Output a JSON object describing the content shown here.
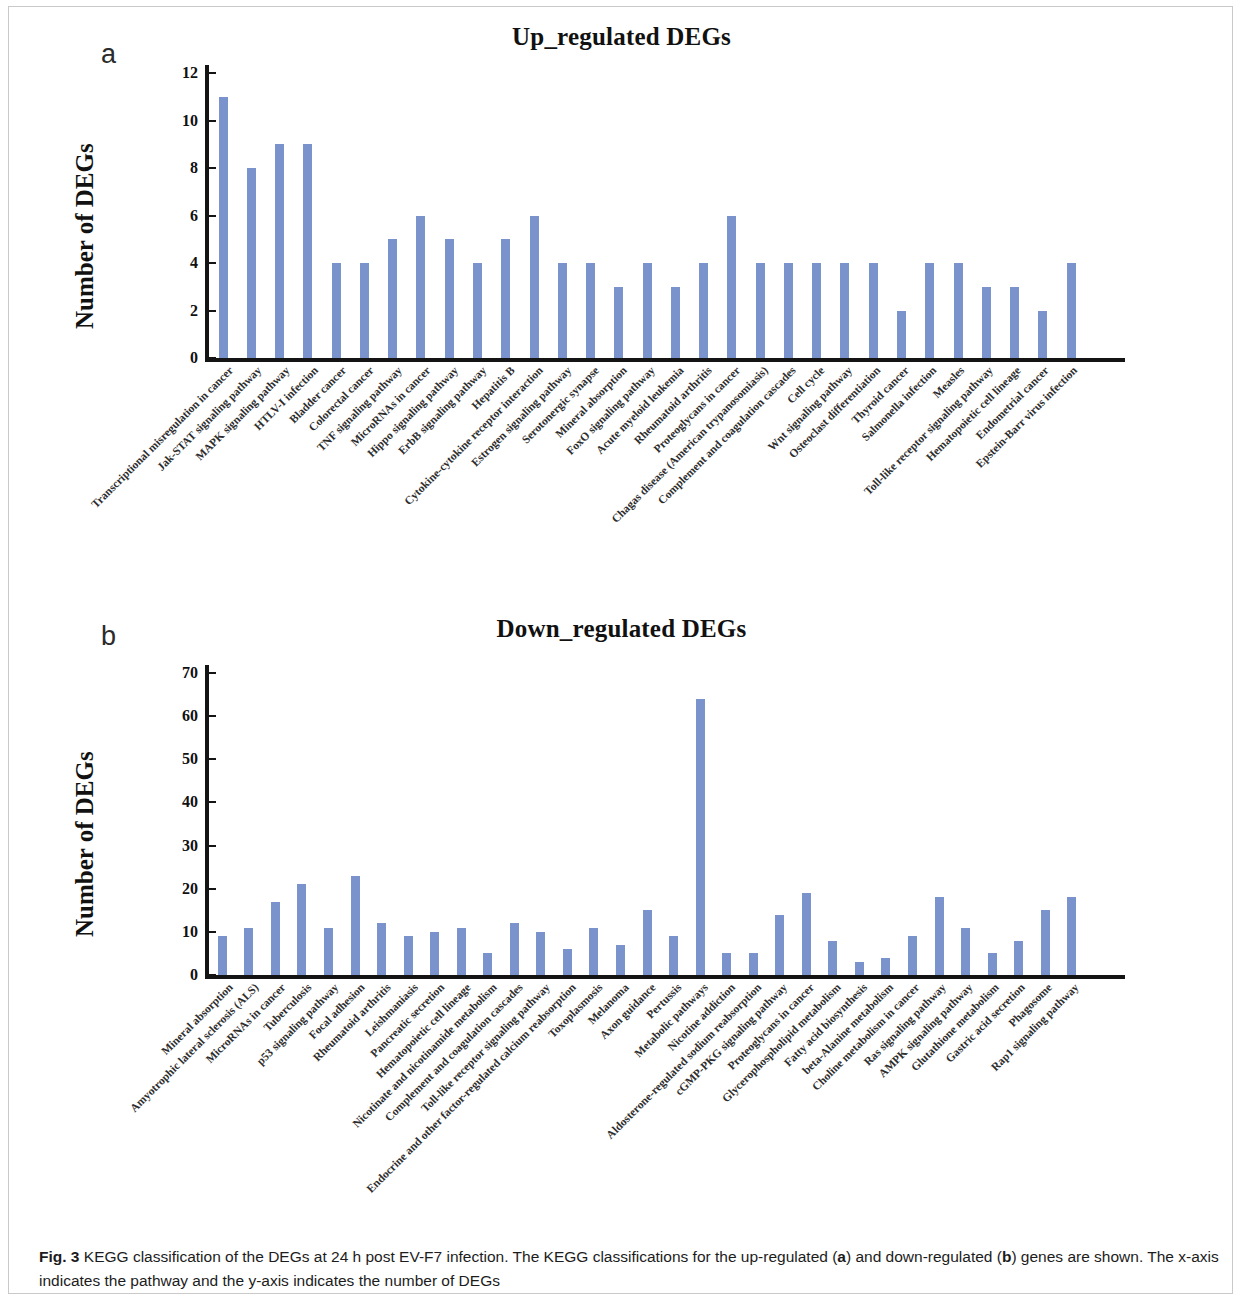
{
  "figure": {
    "caption_label": "Fig. 3",
    "caption_text": " KEGG classification of the DEGs at 24 h post EV-F7 infection. The KEGG classifications for the up-regulated (",
    "caption_a": "a",
    "caption_mid": ") and down-regulated (",
    "caption_b": "b",
    "caption_end": ") genes are shown. The x-axis indicates the pathway and the y-axis indicates the number of DEGs",
    "bar_color": "#7b93cd",
    "axis_color": "#141414"
  },
  "panel_a": {
    "letter": "a",
    "title": "Up_regulated DEGs"
  },
  "panel_b": {
    "letter": "b",
    "title": "Down_regulated DEGs"
  },
  "chart_data": [
    {
      "type": "bar",
      "panel": "a",
      "title": "Up_regulated DEGs",
      "xlabel": "",
      "ylabel": "Number of DEGs",
      "ylim": [
        0,
        12
      ],
      "yticks": [
        0,
        2,
        4,
        6,
        8,
        10,
        12
      ],
      "grid": false,
      "legend": "none",
      "categories": [
        "Transcriptional misregulation in cancer",
        "Jak-STAT signaling pathway",
        "MAPK signaling pathway",
        "HTLV-I infection",
        "Bladder cancer",
        "Colorectal cancer",
        "TNF signaling pathway",
        "MicroRNAs in cancer",
        "Hippo signaling pathway",
        "ErbB signaling pathway",
        "Hepatitis B",
        "Cytokine-cytokine receptor interaction",
        "Estrogen signaling pathway",
        "Serotonergic synapse",
        "Mineral absorption",
        "FoxO signaling pathway",
        "Acute myeloid leukemia",
        "Rheumatoid arthritis",
        "Proteoglycans in cancer",
        "Chagas disease (American trypanosomiasis)",
        "Complement and coagulation cascades",
        "Cell cycle",
        "Wnt signaling pathway",
        "Osteoclast differentiation",
        "Thyroid cancer",
        "Salmonella infection",
        "Measles",
        "Toll-like receptor signaling pathway",
        "Hematopoietic cell lineage",
        "Endometrial cancer",
        "Epstein-Barr virus infection"
      ],
      "values": [
        11,
        8,
        9,
        9,
        4,
        4,
        5,
        6,
        5,
        4,
        5,
        6,
        4,
        4,
        3,
        4,
        3,
        4,
        6,
        4,
        4,
        4,
        4,
        4,
        2,
        4,
        4,
        3,
        3,
        2,
        4
      ]
    },
    {
      "type": "bar",
      "panel": "b",
      "title": "Down_regulated DEGs",
      "xlabel": "",
      "ylabel": "Number of DEGs",
      "ylim": [
        0,
        70
      ],
      "yticks": [
        0,
        10,
        20,
        30,
        40,
        50,
        60,
        70
      ],
      "grid": false,
      "legend": "none",
      "categories": [
        "Mineral absorption",
        "Amyotrophic lateral sclerosis (ALS)",
        "MicroRNAs in cancer",
        "Tuberculosis",
        "p53 signaling pathway",
        "Focal adhesion",
        "Rheumatoid arthritis",
        "Leishmaniasis",
        "Pancreatic secretion",
        "Hematopoietic cell lineage",
        "Nicotinate and nicotinamide metabolism",
        "Complement and coagulation cascades",
        "Toll-like receptor signaling pathway",
        "Endocrine and other factor-regulated calcium reabsorption",
        "Toxoplasmosis",
        "Melanoma",
        "Axon guidance",
        "Pertussis",
        "Metabolic pathways",
        "Nicotine addiction",
        "Aldosterone-regulated sodium reabsorption",
        "cGMP-PKG signaling pathway",
        "Proteoglycans in cancer",
        "Glycerophospholipid metabolism",
        "Fatty acid biosynthesis",
        "beta-Alanine metabolism",
        "Choline metabolism in cancer",
        "Ras signaling pathway",
        "AMPK signaling pathway",
        "Glutathione metabolism",
        "Gastric acid secretion",
        "Phagosome",
        "Rap1 signaling pathway"
      ],
      "values": [
        9,
        11,
        17,
        21,
        11,
        23,
        12,
        9,
        10,
        11,
        5,
        12,
        10,
        6,
        11,
        7,
        15,
        9,
        64,
        5,
        5,
        14,
        19,
        8,
        3,
        4,
        9,
        18,
        11,
        5,
        8,
        15,
        18
      ]
    }
  ]
}
